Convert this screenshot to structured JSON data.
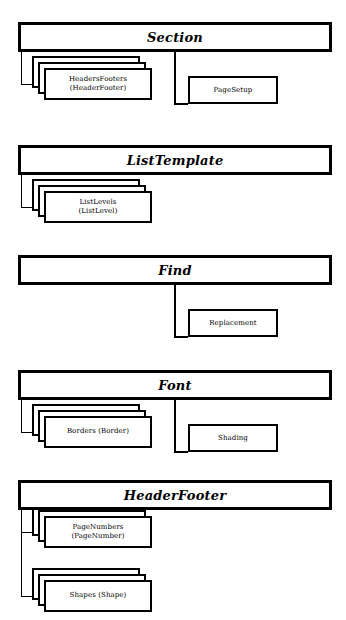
{
  "diagram": {
    "kind": "object-model-hierarchy",
    "groups": [
      {
        "id": "section",
        "title": "Section",
        "collections": [
          {
            "name": "HeadersFooters",
            "item": "(HeaderFooter)"
          }
        ],
        "children": [
          {
            "name": "PageSetup"
          }
        ]
      },
      {
        "id": "listtemplate",
        "title": "ListTemplate",
        "collections": [
          {
            "name": "ListLevels",
            "item": "(ListLevel)"
          }
        ],
        "children": []
      },
      {
        "id": "find",
        "title": "Find",
        "collections": [],
        "children": [
          {
            "name": "Replacement"
          }
        ]
      },
      {
        "id": "font",
        "title": "Font",
        "collections": [
          {
            "name": "Borders (Border)",
            "item": ""
          }
        ],
        "children": [
          {
            "name": "Shading"
          }
        ]
      },
      {
        "id": "headerfooter",
        "title": "HeaderFooter",
        "collections": [
          {
            "name": "PageNumbers",
            "item": "(PageNumber)"
          },
          {
            "name": "Shapes (Shape)",
            "item": ""
          }
        ],
        "children": []
      }
    ]
  },
  "colors": {
    "line": "#000000",
    "background": "#ffffff"
  }
}
